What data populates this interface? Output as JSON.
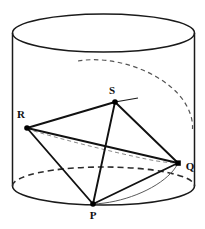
{
  "figure": {
    "background_color": "#ffffff",
    "stroke_color": "#1a1a1a",
    "hidden_stroke_color": "#3a3a3a",
    "helix_stroke_color": "#8a8a8a",
    "width": 205,
    "height": 229
  },
  "cylinder": {
    "name": "cylinder",
    "center_x": 103.5,
    "radius_x": 91,
    "radius_y": 19,
    "top_center_y": 33,
    "bottom_center_y": 186,
    "left_edge_x": 12.5,
    "right_edge_x": 194.5
  },
  "vertices": [
    {
      "id": "P",
      "label": "P",
      "x": 93,
      "y": 204,
      "label_x": 93,
      "label_y": 219,
      "marker": "filled-dot"
    },
    {
      "id": "Q",
      "label": "Q",
      "x": 178,
      "y": 163,
      "label_x": 190,
      "label_y": 170,
      "marker": "filled-dot"
    },
    {
      "id": "R",
      "label": "R",
      "x": 27,
      "y": 128,
      "label_x": 21,
      "label_y": 118,
      "marker": "filled-dot"
    },
    {
      "id": "S",
      "label": "S",
      "x": 115,
      "y": 102,
      "label_x": 112,
      "label_y": 94,
      "marker": "filled-dot"
    }
  ],
  "edges": [
    {
      "id": "RS",
      "from": "R",
      "to": "S",
      "style": "solid"
    },
    {
      "id": "SQ",
      "from": "S",
      "to": "Q",
      "style": "solid"
    },
    {
      "id": "SP",
      "from": "S",
      "to": "P",
      "style": "solid"
    },
    {
      "id": "RP",
      "from": "R",
      "to": "P",
      "style": "solid"
    },
    {
      "id": "PQ",
      "from": "P",
      "to": "Q",
      "style": "solid"
    },
    {
      "id": "RQ",
      "from": "R",
      "to": "Q",
      "style": "solid"
    }
  ],
  "helix": {
    "name": "helix-curve",
    "visible_segments": [
      {
        "id": "helix-P-to-Q",
        "style": "solid-thin"
      },
      {
        "id": "helix-S-tangent",
        "style": "solid-thin"
      }
    ],
    "hidden_segments": [
      {
        "id": "helix-top-back",
        "style": "dashed"
      },
      {
        "id": "helix-mid-back",
        "style": "dashed"
      }
    ]
  },
  "hidden_arcs": [
    {
      "id": "bottom-back-arc",
      "style": "dashed",
      "description": "rear half of bottom ellipse"
    }
  ]
}
